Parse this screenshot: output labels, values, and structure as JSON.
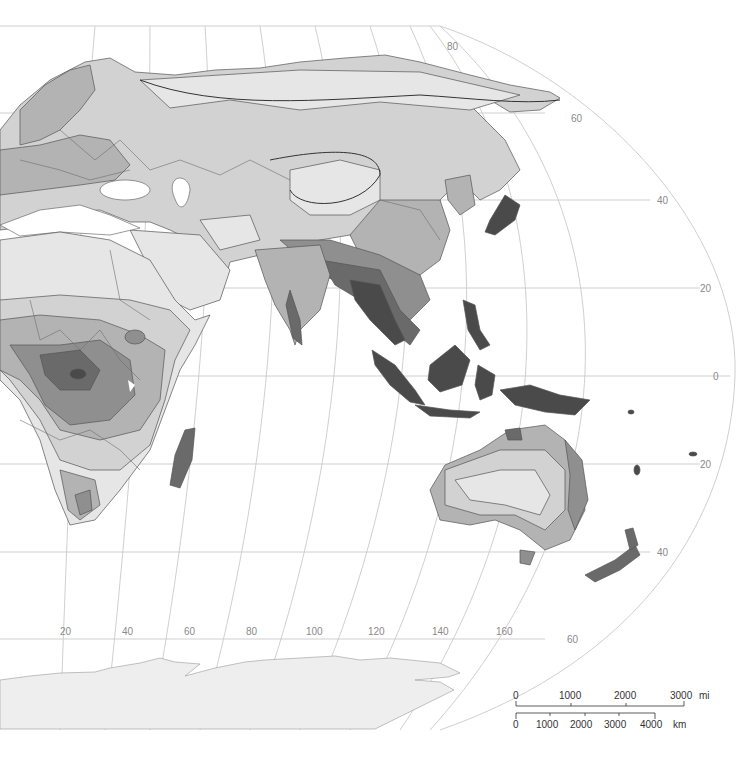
{
  "map": {
    "type": "thematic shaded map (Eastern Hemisphere)",
    "background": "#ffffff",
    "shading_levels": [
      "#e6e6e6",
      "#d2d2d2",
      "#b3b3b3",
      "#8f8f8f",
      "#6a6a6a",
      "#4a4a4a"
    ],
    "latitude_labels": {
      "lat80": "80",
      "lat60_n": "60",
      "lat40_n": "40",
      "lat20_n": "20",
      "lat0": "0",
      "lat20_s": "20",
      "lat40_s": "40",
      "lat60_s": "60"
    },
    "longitude_labels": [
      "20",
      "40",
      "60",
      "80",
      "100",
      "120",
      "140",
      "160"
    ],
    "regions": [
      "Europe",
      "Asia",
      "Africa",
      "Australia",
      "Indonesia",
      "New Zealand",
      "Madagascar",
      "Japan",
      "Antarctica"
    ]
  },
  "scale_bar": {
    "miles": {
      "ticks": [
        "0",
        "1000",
        "2000",
        "3000"
      ],
      "unit": "mi"
    },
    "km": {
      "ticks": [
        "0",
        "1000",
        "2000",
        "3000",
        "4000"
      ],
      "unit": "km"
    }
  }
}
